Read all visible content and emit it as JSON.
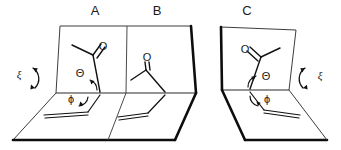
{
  "figure": {
    "background_color": "#ffffff",
    "line_color": "#111111",
    "bold_edge_color": "#0d0d0d"
  },
  "panels": [
    {
      "id": "panel-a",
      "label": "A",
      "label_x": 95,
      "label_y": 12,
      "description": "Left cell of the left folded-plane pair; acetyl group drawn on upper plane, vinyl group on lower plane",
      "angles": [
        {
          "name": "theta",
          "symbol": "Θ",
          "x": 80,
          "y": 74,
          "plane": "upper"
        },
        {
          "name": "phi",
          "symbol": "ϕ",
          "x": 71,
          "y": 100,
          "plane": "lower"
        }
      ],
      "rotation": {
        "name": "xi",
        "symbol": "ξ",
        "x": 19,
        "y": 75,
        "side": "left"
      },
      "atoms": [
        {
          "name": "carbonyl-oxygen",
          "symbol": "O",
          "x": 103,
          "y": 47
        }
      ]
    },
    {
      "id": "panel-b",
      "label": "B",
      "label_x": 157,
      "label_y": 12,
      "description": "Right cell of the left folded-plane pair; rotated acetyl conformer",
      "angles": [],
      "rotation": null,
      "atoms": [
        {
          "name": "carbonyl-oxygen",
          "symbol": "O",
          "x": 147,
          "y": 58
        }
      ]
    },
    {
      "id": "panel-c",
      "label": "C",
      "label_x": 247,
      "label_y": 12,
      "description": "Mirror-image folded plane pair; acetyl and vinyl groups reflected, xi rotation on the right",
      "angles": [
        {
          "name": "theta",
          "symbol": "Θ",
          "x": 266,
          "y": 77,
          "plane": "upper"
        },
        {
          "name": "phi",
          "symbol": "ϕ",
          "x": 267,
          "y": 100,
          "plane": "lower"
        }
      ],
      "rotation": {
        "name": "xi",
        "symbol": "ξ",
        "x": 320,
        "y": 76,
        "side": "right"
      },
      "atoms": [
        {
          "name": "carbonyl-oxygen",
          "symbol": "O",
          "x": 245,
          "y": 50
        }
      ]
    }
  ],
  "legend": {
    "theta_symbol": "Θ",
    "phi_symbol": "ϕ",
    "xi_symbol": "ξ",
    "oxygen_symbol": "O"
  }
}
